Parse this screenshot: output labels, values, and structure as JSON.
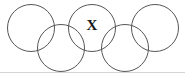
{
  "figure": {
    "name": "overlapping-circles-diagram",
    "width": 185,
    "height": 75,
    "background_color": "#ffffff",
    "stroke_color": "#565656",
    "stroke_width": 1,
    "label_color": "#1a1a1a"
  },
  "chart_data": {
    "type": "diagram",
    "title": "",
    "shape": "circle",
    "count": 5,
    "radius": 23.5,
    "circles": [
      {
        "id": "circle-1",
        "row": "top",
        "cx": 31,
        "cy": 28,
        "r": 23.5,
        "label": ""
      },
      {
        "id": "circle-2",
        "row": "bottom",
        "cx": 61,
        "cy": 48,
        "r": 23.5,
        "label": ""
      },
      {
        "id": "circle-3",
        "row": "top",
        "cx": 92,
        "cy": 28,
        "r": 23.5,
        "label": "X"
      },
      {
        "id": "circle-4",
        "row": "bottom",
        "cx": 125,
        "cy": 48,
        "r": 23.5,
        "label": ""
      },
      {
        "id": "circle-5",
        "row": "top",
        "cx": 155,
        "cy": 28,
        "r": 23.5,
        "label": ""
      }
    ]
  },
  "labels": {
    "x_label": {
      "text": "X",
      "x": 92,
      "y": 27,
      "font_size": 15
    }
  },
  "artifacts": {
    "bottom_edge_line": {
      "name": "page-edge-line",
      "y": 72.5,
      "x1": 0,
      "x2": 185,
      "color": "#d4d4d4",
      "width": 1
    }
  }
}
